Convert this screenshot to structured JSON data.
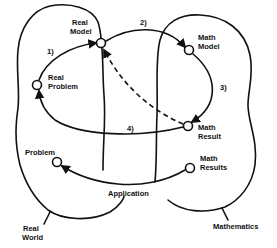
{
  "diagram": {
    "type": "modeling-cycle",
    "colors": {
      "ink": "#111111",
      "background": "#ffffff"
    },
    "regions": [
      {
        "id": "real-world",
        "label_line1": "Real",
        "label_line2": "World"
      },
      {
        "id": "mathematics",
        "label": "Mathematics"
      }
    ],
    "nodes": {
      "real_model": {
        "line1": "Real",
        "line2": "Model"
      },
      "math_model": {
        "line1": "Math",
        "line2": "Model"
      },
      "real_problem": {
        "line1": "Real",
        "line2": "Problem"
      },
      "math_result": {
        "line1": "Math",
        "line2": "Result"
      },
      "problem": {
        "line1": "Problem"
      },
      "math_results": {
        "line1": "Math",
        "line2": "Results"
      }
    },
    "steps": {
      "step1": "1)",
      "step2": "2)",
      "step3": "3)",
      "step4": "4)"
    },
    "connector_label": "Application",
    "edges": [
      {
        "from": "Real Problem",
        "to": "Real Model",
        "label": "1)",
        "style": "solid"
      },
      {
        "from": "Real Model",
        "to": "Math Model",
        "label": "2)",
        "style": "solid"
      },
      {
        "from": "Math Model",
        "to": "Math Result",
        "label": "3)",
        "style": "solid"
      },
      {
        "from": "Math Result",
        "to": "Real Problem",
        "label": "4)",
        "style": "solid"
      },
      {
        "from": "Math Result",
        "to": "Real Model",
        "label": "",
        "style": "dashed"
      },
      {
        "from": "Math Results",
        "to": "Problem",
        "label": "Application",
        "style": "solid"
      }
    ]
  }
}
